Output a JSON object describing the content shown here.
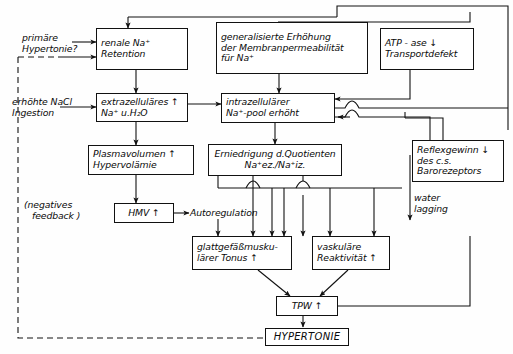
{
  "diagram": {
    "nodes": {
      "renale_na_retention": {
        "line1": "renale Na⁺",
        "line2": "Retention"
      },
      "generalisierte_erhoehung": {
        "line1": "generalisierte Erhöhung",
        "line2": "der Membranpermeabilität",
        "line3": "für Na⁺"
      },
      "atpase": {
        "line1": "ATP - ase  ↓",
        "line2": "Transportdefekt"
      },
      "extrazellulaeres": {
        "line1": "extrazelluläres  ↑",
        "line2": "Na⁺ u.H₂O"
      },
      "intrazellulaerer": {
        "line1": "intrazellulärer",
        "line2": "Na⁺-pool erhöht"
      },
      "plasmavolumen": {
        "line1": "Plasmavolumen  ↑",
        "line2": "Hypervolämie"
      },
      "erniedrigung_quotient": {
        "line1": "Erniedrigung d.Quotienten",
        "line2": "Na⁺ez./Na⁺iz."
      },
      "reflexgewinn": {
        "line1": "Reflexgewinn ↓",
        "line2": "des c.s.",
        "line3": "Barorezeptors"
      },
      "hmv": {
        "line1": "HMV  ↑"
      },
      "glattgefaess": {
        "line1": "glattgefäßmusku-",
        "line2": "lärer Tonus  ↑"
      },
      "vaskulaere": {
        "line1": "vaskuläre",
        "line2": "Reaktivität ↑"
      },
      "tpw": {
        "line1": "TPW  ↑"
      },
      "hypertonie": {
        "line1": "HYPERTONIE"
      }
    },
    "labels": {
      "primaere_hypertonie": {
        "line1": "primäre",
        "line2": "Hypertonie?"
      },
      "erhoehte_nacl": {
        "line1": "erhöhte NaCl",
        "line2": "Ingestion"
      },
      "negatives_feedback": {
        "line1": "(negatives",
        "line2": "feedback )"
      },
      "autoregulation": {
        "line1": "Autoregulation"
      },
      "water_lagging": {
        "line1": "water",
        "line2": "lagging"
      }
    },
    "colors": {
      "stroke": "#111111",
      "background": "#ffffff",
      "text": "#0a0a0a"
    }
  }
}
